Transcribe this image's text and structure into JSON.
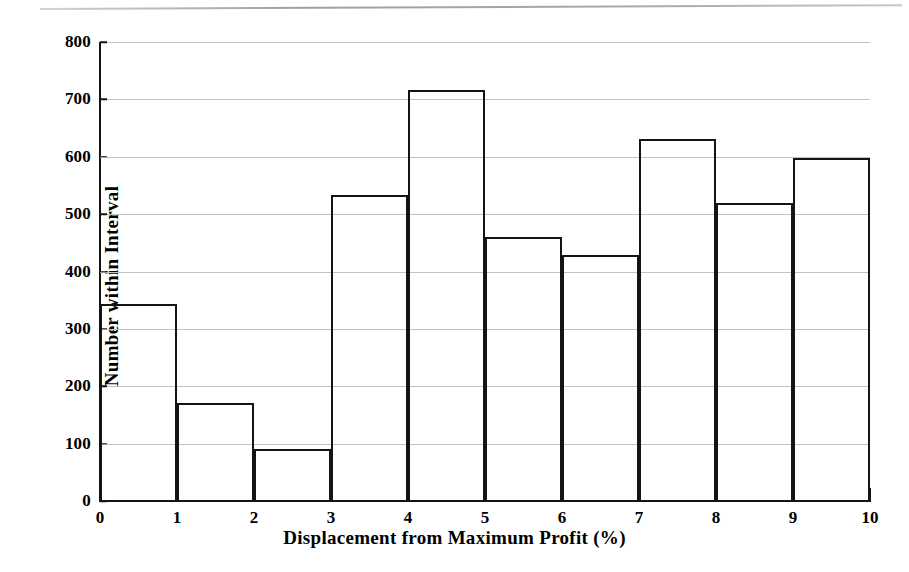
{
  "chart_data": {
    "type": "bar",
    "title": "",
    "subtitle": "",
    "xlabel": "Displacement from Maximum Profit (%)",
    "ylabel": "Number within Interval",
    "xlim": [
      0,
      10
    ],
    "ylim": [
      0,
      800
    ],
    "grid": "horizontal",
    "legend": "none",
    "bin_width": 1,
    "bin_edges": [
      0,
      1,
      2,
      3,
      4,
      5,
      6,
      7,
      8,
      9,
      10
    ],
    "categories": [
      "0-1",
      "1-2",
      "2-3",
      "3-4",
      "4-5",
      "5-6",
      "6-7",
      "7-8",
      "8-9",
      "9-10"
    ],
    "values": [
      343,
      170,
      91,
      534,
      716,
      461,
      428,
      631,
      520,
      598
    ],
    "xticks": [
      "0",
      "1",
      "2",
      "3",
      "4",
      "5",
      "6",
      "7",
      "8",
      "9",
      "10"
    ],
    "yticks": [
      "0",
      "100",
      "200",
      "300",
      "400",
      "500",
      "600",
      "700",
      "800"
    ],
    "ytick_values": [
      0,
      100,
      200,
      300,
      400,
      500,
      600,
      700,
      800
    ],
    "colors": {
      "bar_outline": "#141414",
      "bar_fill": "#ffffff",
      "axis": "#141414",
      "gridline": "#c2c2c2",
      "background": "#ffffff",
      "scan_rule": "#9a9a9a"
    }
  }
}
